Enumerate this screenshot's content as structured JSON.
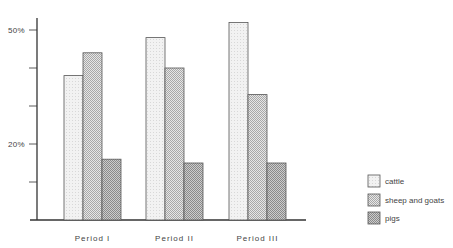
{
  "chart_data": {
    "type": "bar",
    "title": "",
    "xlabel": "",
    "ylabel": "",
    "categories": [
      "Period I",
      "Period II",
      "Period III"
    ],
    "series": [
      {
        "name": "cattle",
        "values": [
          38,
          48,
          52
        ],
        "pattern": "light"
      },
      {
        "name": "sheep and goats",
        "values": [
          44,
          40,
          33
        ],
        "pattern": "medium"
      },
      {
        "name": "pigs",
        "values": [
          16,
          15,
          15
        ],
        "pattern": "dark"
      }
    ],
    "ylim": [
      0,
      50
    ],
    "yticks": [
      0,
      10,
      20,
      30,
      40,
      50
    ],
    "ytick_labels": [
      {
        "value": 50,
        "label": "50%"
      },
      {
        "value": 20,
        "label": "20%"
      }
    ],
    "grid": false,
    "legend_position": "right-bottom"
  },
  "colors": {
    "axis": "#333333",
    "bar_outline": "#555555",
    "light_fill": "#eeeeee",
    "medium_fill": "#cfcfcf",
    "dark_fill": "#b5b5b5"
  }
}
